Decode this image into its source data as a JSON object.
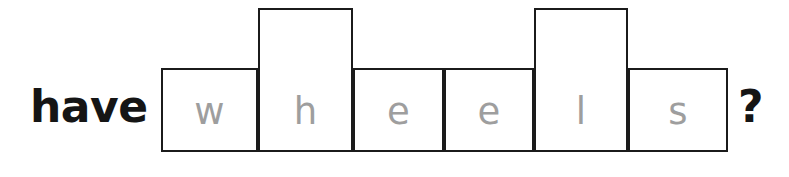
{
  "prompt": {
    "lead_word": "have",
    "trailing_punctuation": "?",
    "full_question": "have wheels ?"
  },
  "word_shape": {
    "word": "wheels",
    "description": "word-shape box outline puzzle",
    "box_fill_color": "#ffffff",
    "box_border_color": "#1b1b1b",
    "letter_color": "#9e9e9e",
    "text_color": "#151515",
    "background_color": "#ffffff",
    "cells": [
      {
        "letter": "w",
        "height_class": "short",
        "x": 161,
        "y": 68,
        "width": 97,
        "height": 84
      },
      {
        "letter": "h",
        "height_class": "tall",
        "x": 258,
        "y": 8,
        "width": 95,
        "height": 144
      },
      {
        "letter": "e",
        "height_class": "short",
        "x": 353,
        "y": 68,
        "width": 91,
        "height": 84
      },
      {
        "letter": "e",
        "height_class": "short",
        "x": 444,
        "y": 68,
        "width": 90,
        "height": 84
      },
      {
        "letter": "l",
        "height_class": "tall",
        "x": 534,
        "y": 8,
        "width": 94,
        "height": 144
      },
      {
        "letter": "s",
        "height_class": "short",
        "x": 628,
        "y": 68,
        "width": 100,
        "height": 84
      }
    ]
  }
}
